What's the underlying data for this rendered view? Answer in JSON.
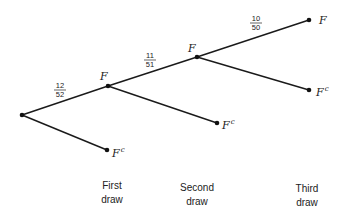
{
  "diagram": {
    "type": "probability-tree",
    "nodes": {
      "root": {
        "x": 22,
        "y": 115
      },
      "first_F": {
        "x": 108,
        "y": 86,
        "label": "F"
      },
      "first_Fc": {
        "x": 107,
        "y": 150,
        "label": "F",
        "sup": "c"
      },
      "second_F": {
        "x": 197,
        "y": 57,
        "label": "F"
      },
      "second_Fc": {
        "x": 217,
        "y": 123,
        "label": "F",
        "sup": "c"
      },
      "third_F": {
        "x": 309,
        "y": 20,
        "label": "F"
      },
      "third_Fc": {
        "x": 309,
        "y": 90,
        "label": "F",
        "sup": "c"
      }
    },
    "edges": [
      {
        "from": "root",
        "to": "first_F",
        "probability": {
          "num": "12",
          "den": "52"
        }
      },
      {
        "from": "root",
        "to": "first_Fc"
      },
      {
        "from": "first_F",
        "to": "second_F",
        "probability": {
          "num": "11",
          "den": "51"
        }
      },
      {
        "from": "first_F",
        "to": "second_Fc"
      },
      {
        "from": "second_F",
        "to": "third_F",
        "probability": {
          "num": "10",
          "den": "50"
        }
      },
      {
        "from": "second_F",
        "to": "third_Fc"
      }
    ],
    "fractions": [
      {
        "num": "12",
        "den": "52"
      },
      {
        "num": "11",
        "den": "51"
      },
      {
        "num": "10",
        "den": "50"
      }
    ],
    "columns": [
      {
        "line1": "First",
        "line2": "draw"
      },
      {
        "line1": "Second",
        "line2": "draw"
      },
      {
        "line1": "Third",
        "line2": "draw"
      }
    ],
    "node_labels": {
      "F": "F",
      "Fc_base": "F",
      "Fc_sup": "c"
    }
  }
}
